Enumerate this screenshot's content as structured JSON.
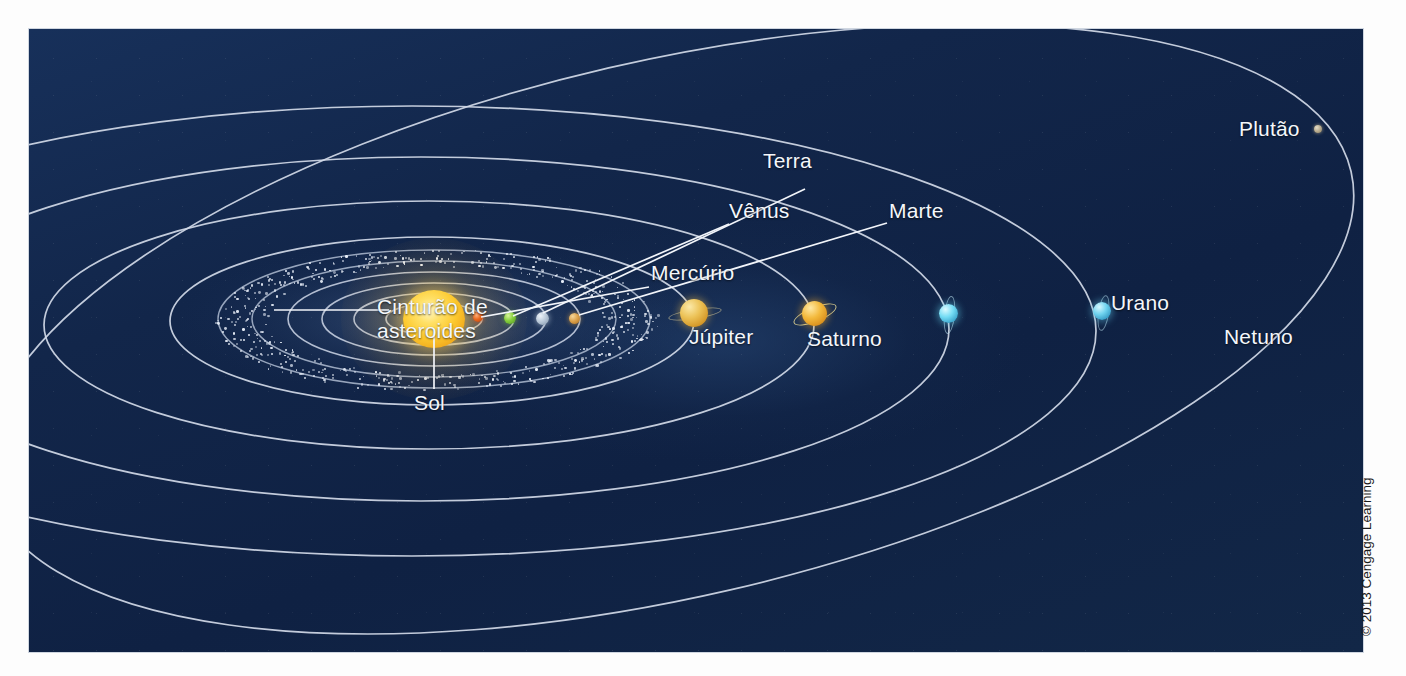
{
  "figure": {
    "background_color": "#12264a",
    "orbit_color": "#d2dae8",
    "label_color": "#f4f7fb"
  },
  "credit": {
    "text": "© 2013 Cengage Learning"
  },
  "labels": {
    "sun": "Sol",
    "mercury": "Mercúrio",
    "venus": "Vênus",
    "earth": "Terra",
    "mars": "Marte",
    "asteroid_belt_line1": "Cinturão de",
    "asteroid_belt_line2": "asteroides",
    "jupiter": "Júpiter",
    "saturn": "Saturno",
    "uranus": "Urano",
    "neptune": "Netuno",
    "pluto": "Plutão"
  },
  "bodies": [
    {
      "name": "Sol",
      "label": "Sol",
      "color": "#ffd54a",
      "size": 60,
      "x": 405,
      "y": 290
    },
    {
      "name": "Mercurio",
      "label": "Mercúrio",
      "color": "#e2601f",
      "size": 9,
      "x": 449,
      "y": 288
    },
    {
      "name": "Venus",
      "label": "Vênus",
      "color": "#77c43a",
      "size": 11,
      "x": 481,
      "y": 289
    },
    {
      "name": "Terra",
      "label": "Terra",
      "color": "#b9c6d4",
      "size": 12,
      "x": 513,
      "y": 290
    },
    {
      "name": "Marte",
      "label": "Marte",
      "color": "#d8a049",
      "size": 10,
      "x": 546,
      "y": 290
    },
    {
      "name": "Jupiter",
      "label": "Júpiter",
      "color": "#e2b34a",
      "size": 28,
      "x": 663,
      "y": 282
    },
    {
      "name": "Saturno",
      "label": "Saturno",
      "color": "#eba32a",
      "size": 25,
      "x": 784,
      "y": 284
    },
    {
      "name": "Urano",
      "label": "Urano",
      "color": "#63d5ef",
      "size": 19,
      "x": 919,
      "y": 285
    },
    {
      "name": "Netuno",
      "label": "Netuno",
      "color": "#64c9ec",
      "size": 18,
      "x": 1073,
      "y": 282
    },
    {
      "name": "Plutao",
      "label": "Plutão",
      "color": "#b9ac90",
      "size": 7,
      "x": 1029,
      "y": 102
    }
  ],
  "chart_data": {
    "type": "diagram",
    "annotations": [
      "Sol",
      "Mercúrio",
      "Vênus",
      "Terra",
      "Marte",
      "Cinturão de asteroides",
      "Júpiter",
      "Saturno",
      "Urano",
      "Netuno",
      "Plutão"
    ],
    "ordered_bodies": [
      "Sol",
      "Mercúrio",
      "Vênus",
      "Terra",
      "Marte",
      "Cinturão de asteroides",
      "Júpiter",
      "Saturno",
      "Urano",
      "Netuno",
      "Plutão"
    ],
    "legend": []
  }
}
